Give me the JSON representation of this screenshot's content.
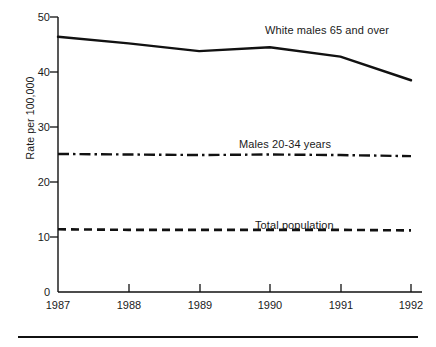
{
  "chart_data": {
    "type": "line",
    "title": "",
    "xlabel": "",
    "ylabel": "Rate per 100,000",
    "x": [
      1987,
      1988,
      1989,
      1990,
      1991,
      1992
    ],
    "xtick_labels": [
      "1987",
      "1988",
      "1989",
      "1990",
      "1991",
      "1992"
    ],
    "ytick_labels": [
      "0",
      "10",
      "20",
      "30",
      "40",
      "50"
    ],
    "yticks": [
      0,
      10,
      20,
      30,
      40,
      50
    ],
    "xlim": [
      1987,
      1992
    ],
    "ylim": [
      0,
      50
    ],
    "grid": false,
    "legend_position": "inline-annotations",
    "series": [
      {
        "name": "White males 65 and over",
        "style": "solid",
        "color": "#111111",
        "values": [
          46.4,
          45.2,
          43.8,
          44.5,
          42.8,
          38.5
        ]
      },
      {
        "name": "Males 20-34 years",
        "style": "dash-dot",
        "color": "#111111",
        "values": [
          25.1,
          25.0,
          24.9,
          25.0,
          24.9,
          24.7
        ]
      },
      {
        "name": "Total population",
        "style": "dashed",
        "color": "#111111",
        "values": [
          11.4,
          11.3,
          11.3,
          11.3,
          11.3,
          11.2
        ]
      }
    ],
    "annotations": [
      {
        "text": "White males 65 and over",
        "x": 1990.1,
        "y": 46.6
      },
      {
        "text": "Males 20-34 years",
        "x": 1989.6,
        "y": 27.2
      },
      {
        "text": "Total population",
        "x": 1989.9,
        "y": 14.0
      }
    ]
  }
}
